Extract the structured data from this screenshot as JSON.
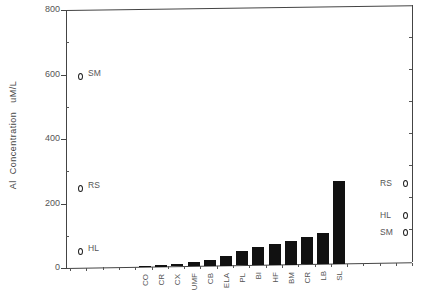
{
  "chart_data": {
    "type": "bar",
    "title": "",
    "xlabel": "",
    "ylabel": "Al  Concentration   uM/L",
    "ylim": [
      0,
      800
    ],
    "yticks": [
      "0",
      "200",
      "400",
      "600",
      "800"
    ],
    "categories": [
      "CO",
      "CR",
      "CX",
      "UMF",
      "CB",
      "ELA",
      "PL",
      "BI",
      "HF",
      "BM",
      "CR",
      "LB",
      "SL"
    ],
    "values": [
      1,
      5,
      7,
      13,
      19,
      31,
      46,
      56,
      65,
      74,
      84,
      96,
      257
    ],
    "bar_color": "#111111",
    "grid": false,
    "legend": null,
    "annotations": {
      "left_markers": [
        {
          "label": "SM",
          "value": 595
        },
        {
          "label": "RS",
          "value": 248
        },
        {
          "label": "HL",
          "value": 53
        }
      ],
      "right_markers": [
        {
          "label": "RS",
          "value": 264
        },
        {
          "label": "HL",
          "value": 164
        },
        {
          "label": "SM",
          "value": 112
        }
      ],
      "marker_shape": "diamond"
    }
  }
}
